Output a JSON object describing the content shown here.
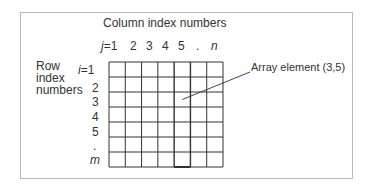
{
  "diagram": {
    "column_title": "Column index numbers",
    "row_title_lines": [
      "Row",
      "index",
      "numbers"
    ],
    "column_labels": [
      {
        "text": "j=1",
        "italic_prefix": "j"
      },
      {
        "text": "2"
      },
      {
        "text": "3"
      },
      {
        "text": "4"
      },
      {
        "text": "5"
      },
      {
        "text": "."
      },
      {
        "text": "n",
        "italic": true
      }
    ],
    "row_labels": [
      {
        "text": "i=1",
        "italic_prefix": "i"
      },
      {
        "text": "2"
      },
      {
        "text": "3"
      },
      {
        "text": "4"
      },
      {
        "text": "5"
      },
      {
        "text": "."
      },
      {
        "text": "m",
        "italic": true
      }
    ],
    "grid": {
      "rows": 7,
      "columns": 7,
      "highlighted_column": 5
    },
    "annotation": {
      "label": "Array element (3,5)",
      "row": 3,
      "column": 5
    },
    "colors": {
      "grid_line": "#333333",
      "frame": "#b8b8b8",
      "text": "#333333",
      "pointer": "#444444"
    }
  }
}
